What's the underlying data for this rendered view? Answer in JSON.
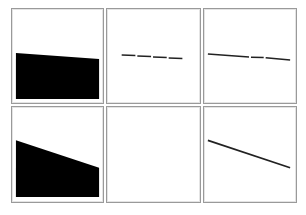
{
  "figure": {
    "layout": {
      "rows": 2,
      "cols": 3
    },
    "colors": {
      "border": "#9a9a9a",
      "fill": "#000000",
      "line": "#222222",
      "background": "#ffffff"
    },
    "panels": [
      {
        "id": "r1c1",
        "kind": "filled-region",
        "description": "black filled area, slightly sloping top edge"
      },
      {
        "id": "r1c2",
        "kind": "dashed-line",
        "description": "four short dashes descending slightly"
      },
      {
        "id": "r1c3",
        "kind": "segmented-line",
        "description": "nearly flat line with small breaks"
      },
      {
        "id": "r2c1",
        "kind": "filled-region",
        "description": "black filled area, steeply sloping top edge"
      },
      {
        "id": "r2c2",
        "kind": "empty",
        "description": "blank panel"
      },
      {
        "id": "r2c3",
        "kind": "line",
        "description": "single descending line"
      }
    ]
  }
}
